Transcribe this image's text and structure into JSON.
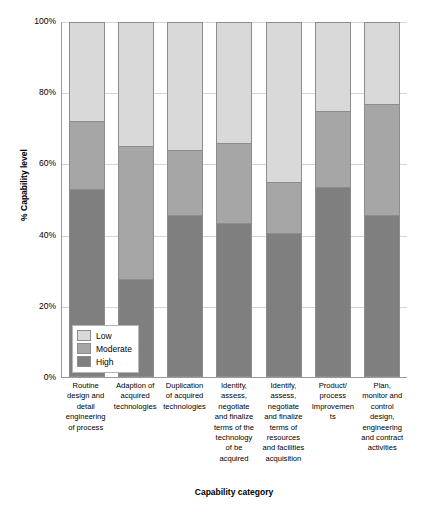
{
  "chart_data": {
    "type": "bar",
    "subtype": "stacked-column-100",
    "title": "",
    "xlabel": "Capability category",
    "ylabel": "% Capability level",
    "ylim": [
      0,
      100
    ],
    "yticks": [
      "0%",
      "20%",
      "40%",
      "60%",
      "80%",
      "100%"
    ],
    "grid": true,
    "legend_position": "inside-bottom-left",
    "categories": [
      "Routine design and detail engineering of process",
      "Adaption of acquired technologies",
      "Duplication of acquired technologies",
      "Identify, assess, negotiate and finalize terms of the technology of be acquired",
      "Identify, assess, negotiate and finalize terms of resources and facilities acquisition",
      "Product/ process Improvements",
      "Plan, monitor and control design, engineering and contract activities"
    ],
    "series": [
      {
        "name": "High",
        "color": "#7f7f7f",
        "values": [
          53,
          27.5,
          45.5,
          43.5,
          40.5,
          53.5,
          45.5
        ]
      },
      {
        "name": "Moderate",
        "color": "#a6a6a6",
        "values": [
          19,
          37.5,
          18.5,
          22.5,
          14.5,
          21.5,
          31.5
        ]
      },
      {
        "name": "Low",
        "color": "#d9d9d9",
        "values": [
          28,
          35,
          36,
          34,
          45,
          25,
          23
        ]
      }
    ],
    "legend": [
      "Low",
      "Moderate",
      "High"
    ]
  },
  "legend_items": [
    {
      "label": "Low",
      "color": "#d9d9d9"
    },
    {
      "label": "Moderate",
      "color": "#a6a6a6"
    },
    {
      "label": "High",
      "color": "#7f7f7f"
    }
  ],
  "axis": {
    "y_title": "% Capability level",
    "x_title": "Capability category"
  }
}
